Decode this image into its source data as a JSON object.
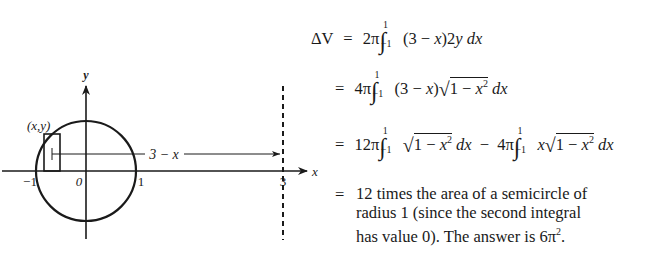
{
  "figure": {
    "axis_labels": {
      "x": "x",
      "y": "y"
    },
    "tick_labels": {
      "neg_one": "−1",
      "zero": "0",
      "one": "1",
      "three": "3"
    },
    "point_label": "(x,y)",
    "distance_label": "3 − x",
    "circle": {
      "center": [
        0,
        0
      ],
      "radius": 1
    },
    "axis_of_rotation": "x = 3"
  },
  "equations": {
    "line1": {
      "lhs": "ΔV",
      "eq": "=",
      "coef": "2π",
      "upper": "1",
      "lower": "−1",
      "integrand_a": "(3 − ",
      "integrand_x": "x",
      "integrand_b": ")2",
      "integrand_y": "y",
      "dx": "dx"
    },
    "line2": {
      "eq": "=",
      "coef": "4π",
      "upper": "1",
      "lower": "−1",
      "integrand_a": "(3 − ",
      "integrand_x": "x",
      "integrand_b": ")",
      "sqrt_body": "1 − ",
      "sqrt_x": "x",
      "sqrt_pow": "2",
      "dx": "dx"
    },
    "line3": {
      "eq": "=",
      "coef1": "12π",
      "upper": "1",
      "lower": "−1",
      "sqrt_body": "1 − ",
      "sqrt_x": "x",
      "sqrt_pow": "2",
      "dx": "dx",
      "minus": "−",
      "coef2": "4π",
      "x": "x"
    },
    "conclusion": {
      "eq": "=",
      "lines": [
        "12 times the area of a semicircle of",
        "radius 1 (since the second integral",
        "has value 0). The answer is 6π"
      ],
      "answer_pow": "2",
      "end": "."
    }
  }
}
